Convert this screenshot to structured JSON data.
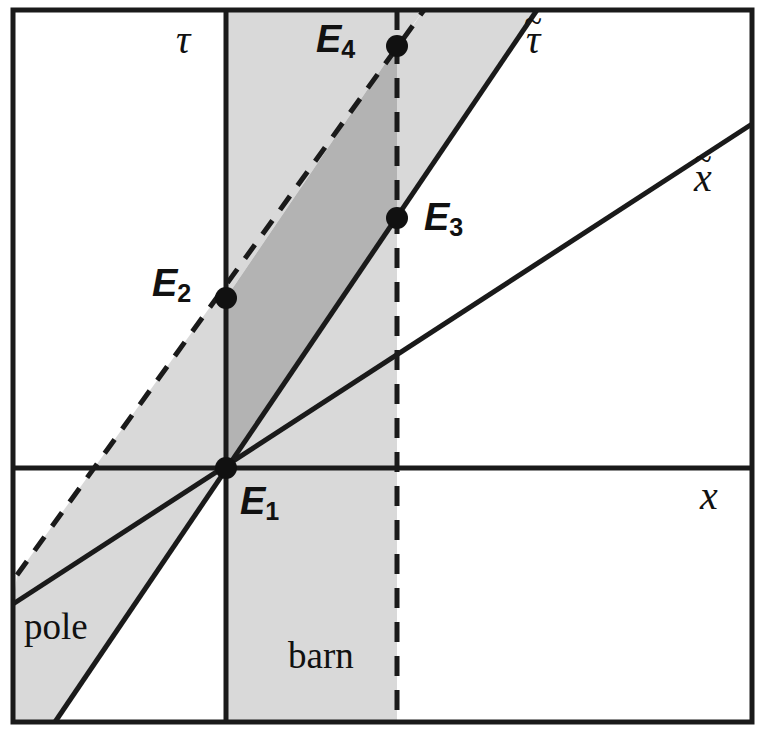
{
  "figure": {
    "kind": "minkowski-spacetime-diagram",
    "background_color": "#ffffff",
    "line_color": "#1a1a1a",
    "shade_light": "#d9d9d9",
    "shade_dark": "#b3b3b3",
    "frame": {
      "x": 13,
      "y": 10,
      "width": 739,
      "height": 712,
      "stroke_width": 5
    }
  },
  "axes": {
    "origin": {
      "x": 226,
      "y": 468
    },
    "tau_label": "τ",
    "x_label": "x",
    "tau_tilde_label": "τ",
    "x_tilde_label": "x",
    "tilde_mark": "~"
  },
  "events": [
    {
      "id": "E1",
      "letter": "E",
      "index": "1",
      "x": 226,
      "y": 468,
      "label_x": 240,
      "label_y": 478
    },
    {
      "id": "E2",
      "letter": "E",
      "index": "2",
      "x": 226,
      "y": 298,
      "label_x": 152,
      "label_y": 262
    },
    {
      "id": "E3",
      "letter": "E",
      "index": "3",
      "x": 397,
      "y": 218,
      "label_x": 424,
      "label_y": 196
    },
    {
      "id": "E4",
      "letter": "E",
      "index": "4",
      "x": 397,
      "y": 46,
      "label_x": 318,
      "label_y": 18
    }
  ],
  "regions": [
    {
      "name": "pole",
      "label": "pole",
      "label_x": 24,
      "label_y": 608,
      "shade": "#d9d9d9"
    },
    {
      "name": "barn",
      "label": "barn",
      "label_x": 288,
      "label_y": 637,
      "shade": "#d9d9d9"
    },
    {
      "name": "overlap",
      "label": "",
      "shade": "#b3b3b3"
    }
  ],
  "worldlines": [
    {
      "name": "tau-axis",
      "style": "solid",
      "from": {
        "x": 226,
        "y": 10
      },
      "to": {
        "x": 226,
        "y": 722
      }
    },
    {
      "name": "x-axis",
      "style": "solid",
      "from": {
        "x": 13,
        "y": 468
      },
      "to": {
        "x": 752,
        "y": 468
      }
    },
    {
      "name": "barn-right-wall",
      "style": "dashed",
      "from": {
        "x": 397,
        "y": 10
      },
      "to": {
        "x": 397,
        "y": 722
      }
    },
    {
      "name": "tau-tilde",
      "style": "solid",
      "from": {
        "x": 55,
        "y": 722
      },
      "to": {
        "x": 537,
        "y": 10
      }
    },
    {
      "name": "x-tilde",
      "style": "solid",
      "from": {
        "x": 13,
        "y": 604
      },
      "to": {
        "x": 752,
        "y": 124
      }
    },
    {
      "name": "pole-rear-edge",
      "style": "dashed",
      "from": {
        "x": 17,
        "y": 575
      },
      "to": {
        "x": 424,
        "y": 10
      }
    }
  ],
  "axis_labels": [
    {
      "name": "tau",
      "text": "τ",
      "tilde": false,
      "x": 176,
      "y": 20
    },
    {
      "name": "x",
      "text": "x",
      "tilde": false,
      "x": 700,
      "y": 478
    },
    {
      "name": "tau-tilde",
      "text": "τ",
      "tilde": true,
      "x": 528,
      "y": 24
    },
    {
      "name": "x-tilde",
      "text": "x",
      "tilde": true,
      "x": 696,
      "y": 160
    }
  ]
}
